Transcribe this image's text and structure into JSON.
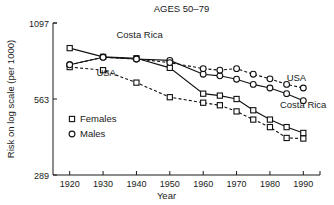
{
  "chart_data": {
    "type": "line",
    "title": "AGES 50–79",
    "xlabel": "Year",
    "ylabel": "Risk on log scale (per 1000)",
    "scale": "log",
    "grid": false,
    "legend_position": "inside-lower-left",
    "xlim": [
      1915,
      1995
    ],
    "ylim": [
      289,
      1097
    ],
    "xticks": [
      1920,
      1930,
      1940,
      1950,
      1960,
      1970,
      1980,
      1990
    ],
    "xticklabels": [
      "1920",
      "1930",
      "1940",
      "1950",
      "1960",
      "1970",
      "1980",
      "1990"
    ],
    "yticks": [
      289,
      563,
      1097
    ],
    "yticklabels": [
      "289",
      "563",
      "1097"
    ],
    "legend": [
      {
        "label": "Females",
        "marker": "square"
      },
      {
        "label": "Males",
        "marker": "circle"
      }
    ],
    "annotations": [
      {
        "text": "Costa Rica",
        "x": 1934,
        "y": 960
      },
      {
        "text": "USA",
        "x": 1928,
        "y": 690
      },
      {
        "text": "USA",
        "x": 1985,
        "y": 660
      },
      {
        "text": "Costa Rica",
        "x": 1983,
        "y": 520
      }
    ],
    "series": [
      {
        "name": "Costa Rica Females",
        "country": "Costa Rica",
        "sex": "Females",
        "marker": "square",
        "line": "solid",
        "x": [
          1920,
          1930,
          1940,
          1950,
          1960,
          1965,
          1970,
          1975,
          1980,
          1985,
          1990
        ],
        "y": [
          880,
          815,
          805,
          740,
          590,
          580,
          563,
          510,
          470,
          440,
          418
        ]
      },
      {
        "name": "Costa Rica Males",
        "country": "Costa Rica",
        "sex": "Males",
        "marker": "circle",
        "line": "solid",
        "x": [
          1920,
          1930,
          1940,
          1950,
          1960,
          1965,
          1970,
          1975,
          1980,
          1985,
          1990
        ],
        "y": [
          760,
          812,
          800,
          790,
          700,
          690,
          670,
          640,
          620,
          590,
          555
        ]
      },
      {
        "name": "USA Females",
        "country": "USA",
        "sex": "Females",
        "marker": "square",
        "line": "dashed",
        "x": [
          1920,
          1930,
          1940,
          1950,
          1960,
          1965,
          1970,
          1975,
          1980,
          1985,
          1990
        ],
        "y": [
          745,
          725,
          650,
          572,
          545,
          533,
          505,
          470,
          440,
          400,
          398
        ]
      },
      {
        "name": "USA Males",
        "country": "USA",
        "sex": "Males",
        "marker": "circle",
        "line": "dashed",
        "x": [
          1920,
          1930,
          1940,
          1950,
          1960,
          1965,
          1970,
          1975,
          1980,
          1985,
          1990
        ],
        "y": [
          760,
          812,
          800,
          775,
          735,
          725,
          735,
          700,
          672,
          640,
          620
        ]
      }
    ]
  }
}
